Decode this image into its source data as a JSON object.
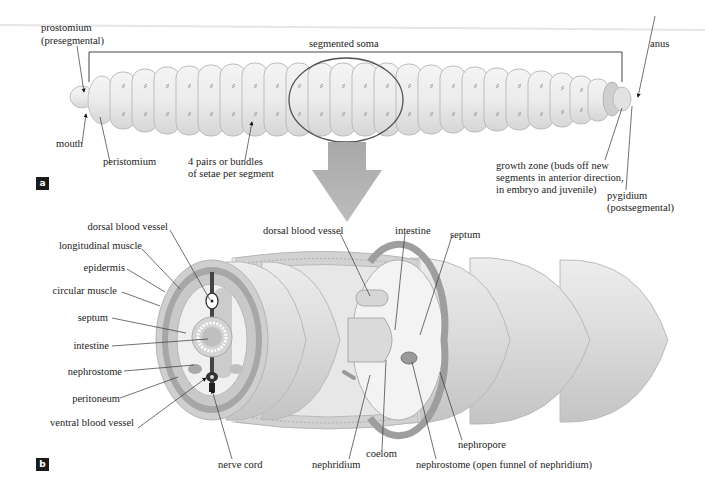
{
  "figure": {
    "panels": [
      {
        "id": "a",
        "badge": "a",
        "title": "Earthworm external anatomy"
      },
      {
        "id": "b",
        "badge": "b",
        "title": "Earthworm segment cutaway"
      }
    ]
  },
  "panel_a": {
    "labels": {
      "prostomium": "prostomium",
      "prostomium_note": "(presegmental)",
      "segmented_soma": "segmented soma",
      "anus": "anus",
      "mouth": "mouth",
      "peristomium": "peristomium",
      "setae_line1": "4 pairs or bundles",
      "setae_line2": "of setae per segment",
      "growth_line1": "growth zone (buds off new",
      "growth_line2": "segments in anterior direction,",
      "growth_line3": "in embryo and juvenile)",
      "pygidium": "pygidium",
      "pygidium_note": "(postsegmental)"
    }
  },
  "panel_b": {
    "labels_left": [
      "dorsal blood vessel",
      "longitudinal muscle",
      "epidermis",
      "circular muscle",
      "septum",
      "intestine",
      "nephrostome",
      "peritoneum",
      "ventral blood vessel"
    ],
    "labels_inner": {
      "dorsal_blood_vessel": "dorsal blood vessel",
      "intestine": "intestine",
      "septum": "septum",
      "nerve_cord": "nerve cord",
      "nephridium": "nephridium",
      "coelom": "coelom",
      "nephropore": "nephropore",
      "nephrostome_open": "nephrostome (open funnel of nephridium)"
    }
  },
  "colors": {
    "worm_fill": "#e9e9e9",
    "worm_stroke": "#b8b8b8",
    "outline": "#555555",
    "arrow": "#b0b0b0",
    "muscle_dark": "#9a9a9a",
    "muscle_mid": "#bdbdbd",
    "coelom_light": "#f2f2f2",
    "badge_bg": "#1a1a1a"
  }
}
